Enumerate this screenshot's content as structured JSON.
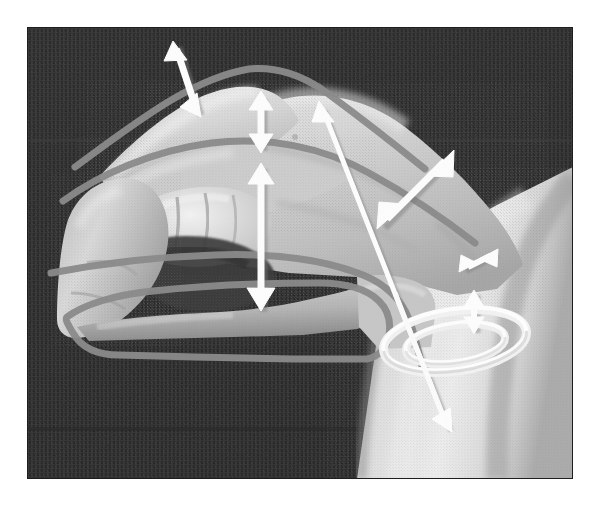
{
  "figure": {
    "kind": "photograph",
    "view": "lateral (radial) view, fingers pointing left, forearm entering from lower right",
    "overlay_style": "white arrow annotations over grayscale photo with gray traced outline",
    "canvas": {
      "width": 593,
      "height": 509
    },
    "photo_bounds": {
      "x": 27,
      "y": 27,
      "width": 546,
      "height": 452
    },
    "alt_text": "Grayscale photograph of a hand held in a hooked-fist position against dark woven fabric. White double-headed arrows mark the range of motion of the distal, proximal and metacarpophalangeal finger joints, a long white axis line runs diagonally across the hand into a white rotation ellipse drawn around the wrist, and a gray traced contour outlines the finger and palm silhouette."
  },
  "colors": {
    "background_fabric_dark": "#2b2b2b",
    "background_fabric_mid": "#3a3a3a",
    "skin_light": "#dcdcdc",
    "skin_mid": "#c4c4c4",
    "skin_shadow": "#9a9a9a",
    "skin_deep_shadow": "#6e6e6e",
    "annotation_white": "#fdfdfd",
    "annotation_shadow": "#8d8d8d",
    "trace_outline_gray": "#8a8a8a",
    "page_white": "#ffffff"
  },
  "annotations": {
    "arrows": [
      {
        "id": "dip-range-arrow",
        "name": "distal-interphalangeal-range-arrow",
        "label": "DIP joint excursion",
        "style": "double-headed",
        "orientation": "oblique, tilted right about 18 degrees from vertical",
        "from": {
          "x": 176,
          "y": 44
        },
        "to": {
          "x": 198,
          "y": 112
        },
        "length_px": 71
      },
      {
        "id": "pip-range-arrow",
        "name": "proximal-interphalangeal-range-arrow",
        "label": "PIP joint excursion",
        "style": "double-headed",
        "orientation": "vertical",
        "from": {
          "x": 261,
          "y": 96
        },
        "to": {
          "x": 261,
          "y": 148
        },
        "length_px": 52
      },
      {
        "id": "mcp-range-arrow",
        "name": "metacarpophalangeal-range-arrow",
        "label": "MCP joint excursion",
        "style": "double-headed",
        "orientation": "vertical",
        "from": {
          "x": 261,
          "y": 166
        },
        "to": {
          "x": 261,
          "y": 309
        },
        "length_px": 143
      },
      {
        "id": "wrist-flexion-axis-arrow",
        "name": "wrist-flexion-axis-arrow",
        "label": "long flexion / extension axis through the hand",
        "style": "double-headed, long thin shaft",
        "orientation": "diagonal from upper left to lower right",
        "from": {
          "x": 322,
          "y": 108
        },
        "to": {
          "x": 448,
          "y": 428
        },
        "length_px": 344
      },
      {
        "id": "radial-deviation-arrow",
        "name": "radial-deviation-range-arrow",
        "label": "radial / ulnar excursion of the hand dorsum",
        "style": "double-headed",
        "orientation": "diagonal, up-right and down-left",
        "from": {
          "x": 450,
          "y": 155
        },
        "to": {
          "x": 382,
          "y": 225
        },
        "length_px": 97
      },
      {
        "id": "wrist-small-range-arrow",
        "name": "wrist-small-range-arrow",
        "label": "small wrist translation",
        "style": "double-headed",
        "orientation": "diagonal, up-right and down-left",
        "from": {
          "x": 495,
          "y": 252
        },
        "to": {
          "x": 463,
          "y": 268
        },
        "length_px": 36
      },
      {
        "id": "pronation-supination-arrow",
        "name": "pronation-supination-range-arrow",
        "label": "vertical excursion inside rotation ring",
        "style": "double-headed",
        "orientation": "vertical",
        "from": {
          "x": 474,
          "y": 292
        },
        "to": {
          "x": 474,
          "y": 330
        },
        "length_px": 38
      }
    ],
    "rotation_ring": {
      "id": "forearm-rotation-ellipse",
      "name": "forearm-rotation-ellipse",
      "label": "forearm pronation / supination rotation ring",
      "description": "white three-dimensional torus drawn around the distal forearm, pierced by the long axis arrow",
      "center": {
        "x": 455,
        "y": 341
      },
      "radius_x": 72,
      "radius_y": 30,
      "band_thickness_px": 9,
      "tilt_deg": -8
    },
    "trace_outline": {
      "id": "hand-silhouette-trace",
      "name": "hand-silhouette-trace",
      "label": "gray traced outline of finger and palm contours",
      "stroke_color": "#8a8a8a",
      "stroke_width_px": 7,
      "segments": [
        "dorsal contour of the proximal phalanx running from the knuckle ridge up to the fingertip",
        "contour along the dorsum of the hand from the index knuckle to the wrist crease",
        "lower palm / little-finger border contour running left to the hypothenar edge",
        "wrist-level step contour bracketing the carpus"
      ]
    }
  },
  "measurements": {
    "joints_marked": [
      "distal interphalangeal joint",
      "proximal interphalangeal joint",
      "metacarpophalangeal joint",
      "wrist",
      "forearm rotation axis"
    ],
    "arrow_count": 7,
    "double_headed_arrow_count": 7,
    "rotation_ring_count": 1
  }
}
